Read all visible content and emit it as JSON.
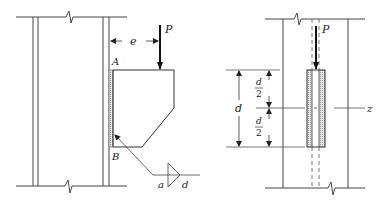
{
  "figure_left": {
    "load_label": "P",
    "eccentricity_label": "e",
    "point_a_label": "A",
    "point_b_label": "B",
    "weld_symbol": {
      "left_label": "a",
      "right_label": "d"
    }
  },
  "figure_right": {
    "load_label": "P",
    "depth_label": "d",
    "half_depth_top": {
      "numerator": "d",
      "denominator": "2"
    },
    "half_depth_bottom": {
      "numerator": "d",
      "denominator": "2"
    },
    "axis_label": "z"
  },
  "colors": {
    "line": "#333333",
    "hatch": "#999999",
    "background": "#ffffff"
  }
}
